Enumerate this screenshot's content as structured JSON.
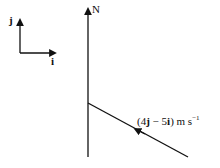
{
  "unit_vectors": {
    "j_label": "j",
    "i_label": "i"
  },
  "north_label": "N",
  "velocity": {
    "vector": "(4j − 5i)",
    "j": "j",
    "i": "i",
    "open": "(4",
    "mid": " − 5",
    "close": ")",
    "units": "m s",
    "exp": "−1"
  },
  "colors": {
    "line": "#111111",
    "background": "#ffffff"
  }
}
